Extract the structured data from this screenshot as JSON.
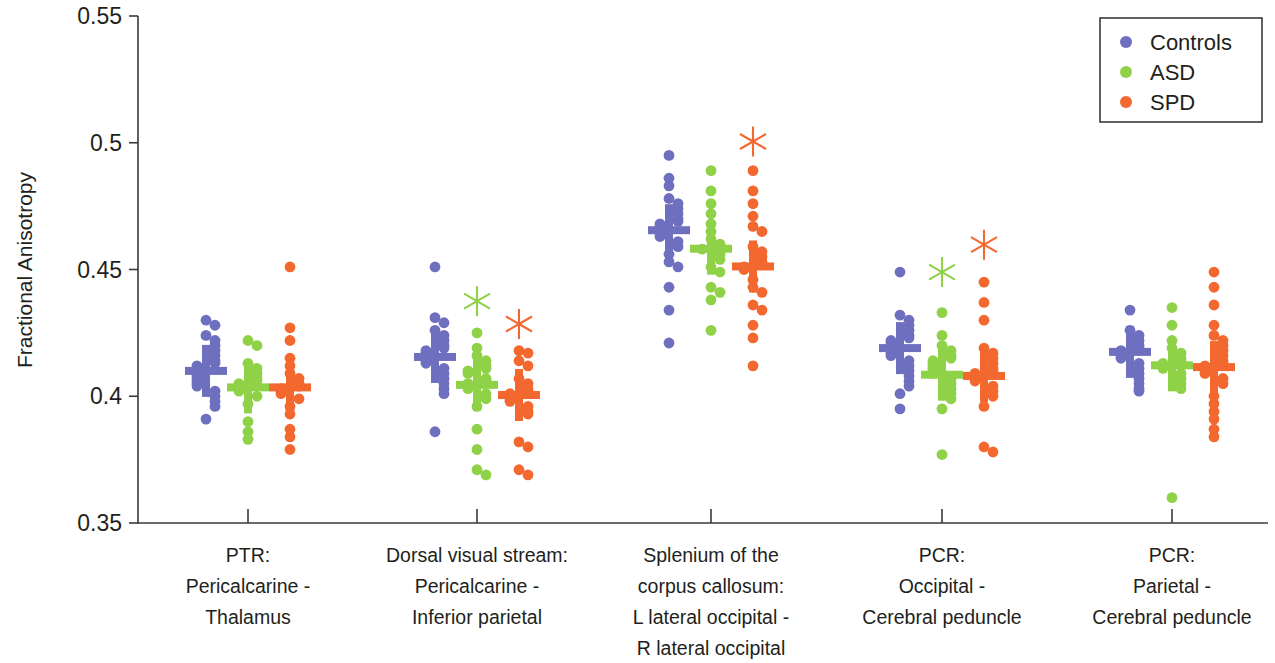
{
  "chart_data": {
    "type": "scatter",
    "title": "",
    "xlabel": "",
    "ylabel": "Fractional Anisotropy",
    "ylim": [
      0.35,
      0.55
    ],
    "yticks": [
      0.35,
      0.4,
      0.45,
      0.5,
      0.55
    ],
    "ytick_labels": [
      "0.35",
      "0.4",
      "0.45",
      "0.5",
      "0.55"
    ],
    "grid": false,
    "legend_position": "top-right",
    "legend": [
      {
        "name": "Controls",
        "color": "#6f6fc0"
      },
      {
        "name": "ASD",
        "color": "#8fd147"
      },
      {
        "name": "SPD",
        "color": "#f2682f"
      }
    ],
    "categories": [
      "PTR:\nPericalcarine -\nThalamus",
      "Dorsal visual stream:\nPericalcarine -\nInferior parietal",
      "Splenium of the\ncorpus callosum:\nL lateral occipital -\nR lateral occipital",
      "PCR:\nOccipital -\nCerebral peduncle",
      "PCR:\nParietal -\nCerebral peduncle"
    ],
    "category_label_lines": [
      [
        "PTR:",
        "Pericalcarine -",
        "Thalamus"
      ],
      [
        "Dorsal visual stream:",
        "Pericalcarine -",
        "Inferior parietal"
      ],
      [
        "Splenium of the",
        "corpus callosum:",
        "L lateral occipital -",
        "R lateral occipital"
      ],
      [
        "PCR:",
        "Occipital -",
        "Cerebral peduncle"
      ],
      [
        "PCR:",
        "Parietal -",
        "Cerebral peduncle"
      ]
    ],
    "marker_shape": "circle",
    "median_marker": "horizontal-bar",
    "significance_marker": "asterisk",
    "groups": [
      {
        "category": "PTR:\nPericalcarine -\nThalamus",
        "series": [
          {
            "name": "Controls",
            "color": "#6f6fc0",
            "median": 0.41,
            "significance": null,
            "values": [
              0.43,
              0.428,
              0.424,
              0.422,
              0.42,
              0.418,
              0.416,
              0.414,
              0.413,
              0.412,
              0.411,
              0.41,
              0.409,
              0.408,
              0.407,
              0.406,
              0.405,
              0.404,
              0.402,
              0.4,
              0.398,
              0.396,
              0.391
            ]
          },
          {
            "name": "ASD",
            "color": "#8fd147",
            "median": 0.4035,
            "significance": null,
            "values": [
              0.422,
              0.42,
              0.413,
              0.411,
              0.409,
              0.407,
              0.406,
              0.405,
              0.404,
              0.403,
              0.402,
              0.4,
              0.397,
              0.39,
              0.386,
              0.383
            ]
          },
          {
            "name": "SPD",
            "color": "#f2682f",
            "median": 0.4035,
            "significance": null,
            "values": [
              0.451,
              0.427,
              0.422,
              0.415,
              0.412,
              0.409,
              0.407,
              0.405,
              0.404,
              0.403,
              0.402,
              0.401,
              0.399,
              0.396,
              0.393,
              0.387,
              0.384,
              0.379
            ]
          }
        ]
      },
      {
        "category": "Dorsal visual stream:\nPericalcarine -\nInferior parietal",
        "series": [
          {
            "name": "Controls",
            "color": "#6f6fc0",
            "median": 0.4155,
            "significance": null,
            "values": [
              0.451,
              0.431,
              0.429,
              0.426,
              0.424,
              0.422,
              0.42,
              0.419,
              0.418,
              0.417,
              0.416,
              0.415,
              0.414,
              0.413,
              0.411,
              0.409,
              0.407,
              0.405,
              0.403,
              0.401,
              0.386
            ]
          },
          {
            "name": "ASD",
            "color": "#8fd147",
            "median": 0.4045,
            "significance": 0.4375,
            "values": [
              0.425,
              0.419,
              0.416,
              0.414,
              0.412,
              0.411,
              0.41,
              0.409,
              0.407,
              0.406,
              0.405,
              0.404,
              0.403,
              0.401,
              0.399,
              0.396,
              0.387,
              0.379,
              0.371,
              0.369
            ]
          },
          {
            "name": "SPD",
            "color": "#f2682f",
            "median": 0.4005,
            "significance": 0.4285,
            "values": [
              0.418,
              0.417,
              0.414,
              0.412,
              0.407,
              0.405,
              0.403,
              0.402,
              0.401,
              0.4,
              0.399,
              0.398,
              0.396,
              0.394,
              0.393,
              0.382,
              0.38,
              0.371,
              0.369
            ]
          }
        ]
      },
      {
        "category": "Splenium of the\ncorpus callosum:\nL lateral occipital -\nR lateral occipital",
        "series": [
          {
            "name": "Controls",
            "color": "#6f6fc0",
            "median": 0.4655,
            "significance": null,
            "values": [
              0.495,
              0.486,
              0.483,
              0.478,
              0.476,
              0.474,
              0.472,
              0.47,
              0.469,
              0.468,
              0.467,
              0.466,
              0.465,
              0.464,
              0.463,
              0.461,
              0.459,
              0.456,
              0.453,
              0.451,
              0.443,
              0.434,
              0.421
            ]
          },
          {
            "name": "ASD",
            "color": "#8fd147",
            "median": 0.4582,
            "significance": null,
            "values": [
              0.489,
              0.481,
              0.476,
              0.472,
              0.468,
              0.465,
              0.462,
              0.46,
              0.459,
              0.458,
              0.456,
              0.454,
              0.451,
              0.449,
              0.443,
              0.441,
              0.438,
              0.426
            ]
          },
          {
            "name": "SPD",
            "color": "#f2682f",
            "median": 0.4512,
            "significance": 0.5005,
            "values": [
              0.489,
              0.481,
              0.476,
              0.471,
              0.467,
              0.465,
              0.459,
              0.457,
              0.455,
              0.453,
              0.452,
              0.451,
              0.45,
              0.446,
              0.443,
              0.441,
              0.436,
              0.434,
              0.428,
              0.423,
              0.412
            ]
          }
        ]
      },
      {
        "category": "PCR:\nOccipital -\nCerebral peduncle",
        "series": [
          {
            "name": "Controls",
            "color": "#6f6fc0",
            "median": 0.419,
            "significance": null,
            "values": [
              0.449,
              0.432,
              0.43,
              0.428,
              0.426,
              0.424,
              0.423,
              0.422,
              0.421,
              0.42,
              0.419,
              0.418,
              0.417,
              0.416,
              0.414,
              0.412,
              0.41,
              0.408,
              0.406,
              0.404,
              0.401,
              0.395
            ]
          },
          {
            "name": "ASD",
            "color": "#8fd147",
            "median": 0.4085,
            "significance": 0.449,
            "values": [
              0.433,
              0.424,
              0.42,
              0.418,
              0.416,
              0.415,
              0.414,
              0.413,
              0.412,
              0.411,
              0.41,
              0.409,
              0.407,
              0.405,
              0.403,
              0.401,
              0.399,
              0.395,
              0.377
            ]
          },
          {
            "name": "SPD",
            "color": "#f2682f",
            "median": 0.408,
            "significance": 0.4598,
            "values": [
              0.445,
              0.437,
              0.43,
              0.419,
              0.417,
              0.415,
              0.413,
              0.411,
              0.41,
              0.409,
              0.408,
              0.407,
              0.406,
              0.404,
              0.402,
              0.4,
              0.396,
              0.38,
              0.378
            ]
          }
        ]
      },
      {
        "category": "PCR:\nParietal -\nCerebral peduncle",
        "series": [
          {
            "name": "Controls",
            "color": "#6f6fc0",
            "median": 0.4175,
            "significance": null,
            "values": [
              0.434,
              0.426,
              0.424,
              0.422,
              0.42,
              0.419,
              0.418,
              0.417,
              0.416,
              0.415,
              0.413,
              0.411,
              0.409,
              0.407,
              0.405,
              0.403,
              0.402
            ]
          },
          {
            "name": "ASD",
            "color": "#8fd147",
            "median": 0.4122,
            "significance": null,
            "values": [
              0.435,
              0.428,
              0.422,
              0.419,
              0.417,
              0.415,
              0.414,
              0.413,
              0.412,
              0.411,
              0.409,
              0.407,
              0.405,
              0.403,
              0.36
            ]
          },
          {
            "name": "SPD",
            "color": "#f2682f",
            "median": 0.4115,
            "significance": null,
            "values": [
              0.449,
              0.443,
              0.436,
              0.428,
              0.424,
              0.422,
              0.42,
              0.418,
              0.416,
              0.414,
              0.413,
              0.412,
              0.411,
              0.41,
              0.409,
              0.407,
              0.405,
              0.4,
              0.397,
              0.394,
              0.391,
              0.387,
              0.384
            ]
          }
        ]
      }
    ]
  }
}
